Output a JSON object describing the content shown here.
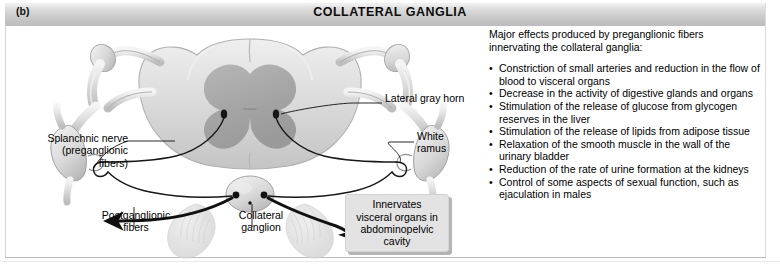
{
  "figure": {
    "panel_letter": "(b)",
    "title": "COLLATERAL GANGLIA"
  },
  "diagram": {
    "labels": {
      "splanchnic_nerve": "Splanchnic nerve\n(preganglionic\nfibers)",
      "postganglionic_fibers": "Postganglionic\nfibers",
      "collateral_ganglion": "Collateral\nganglion",
      "lateral_gray_horn": "Lateral gray horn",
      "white_ramus": "White\nramus"
    },
    "callout": "Innervates\nvisceral organs in\nabdominopelvic\ncavity",
    "colors": {
      "gray_matter": "#a9a9a9",
      "white_matter": "#d9d9d9",
      "nerve_outline": "#8e8e8e",
      "fiber_line": "#1a1a1a",
      "organ_tint": "#dedede",
      "header_gradient_top": "#f2f2f2",
      "header_gradient_bottom": "#bcbcbc",
      "callout_fill": "#e3e3e3"
    }
  },
  "text_panel": {
    "intro": "Major effects produced by preganglionic fibers\ninnervating the collateral ganglia:",
    "effects": [
      "Constriction of small arteries and reduction in the flow of blood to visceral organs",
      "Decrease in the activity of digestive glands and organs",
      "Stimulation of the release of glucose from glycogen reserves in the liver",
      "Stimulation of the release of lipids from adipose tissue",
      "Relaxation of the smooth muscle in the wall of the urinary bladder",
      "Reduction of the rate of urine formation at the kidneys",
      "Control of some aspects of sexual function, such as ejaculation in males"
    ]
  }
}
